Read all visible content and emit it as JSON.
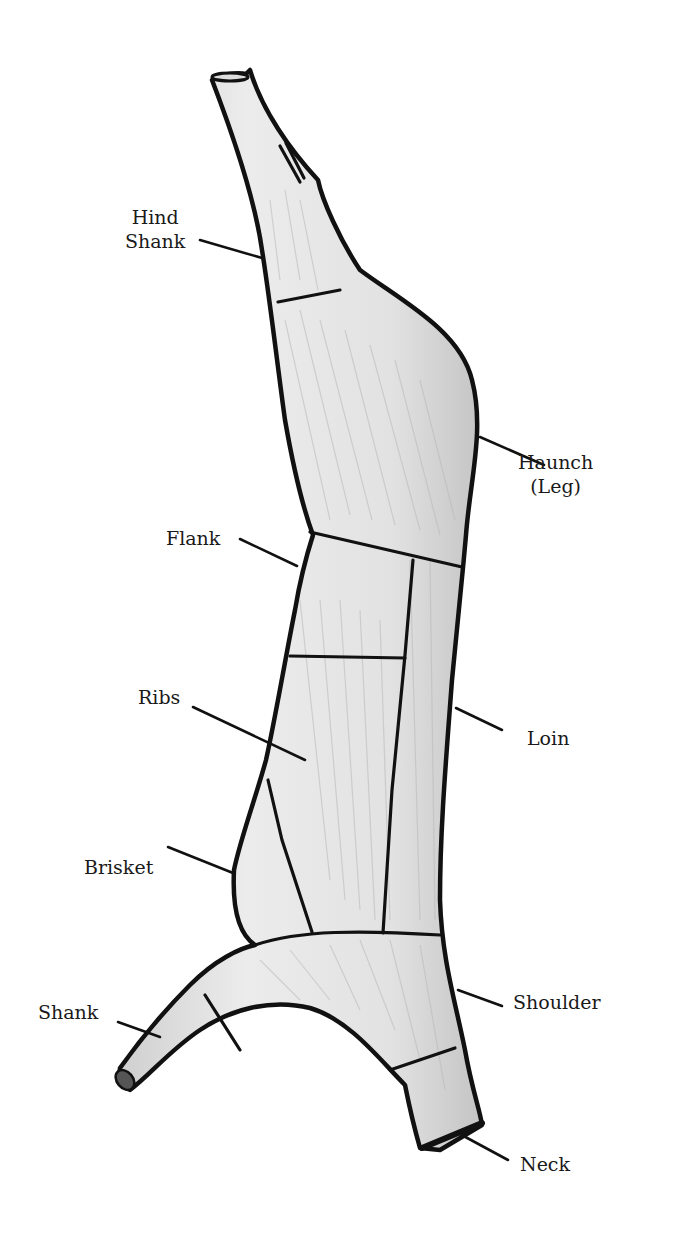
{
  "diagram": {
    "title": "",
    "style": "pencil sketch, grayscale",
    "colors": {
      "outline": "#111111",
      "fill": "#e6e6e6",
      "shading": "#b8b8b8",
      "background": "#ffffff"
    },
    "labels": [
      {
        "id": "hind-shank",
        "lines": [
          "Hind",
          "Shank"
        ],
        "x": 125,
        "y": 205,
        "align": "center",
        "leader": [
          [
            200,
            240
          ],
          [
            262,
            258
          ]
        ]
      },
      {
        "id": "haunch",
        "lines": [
          "Haunch",
          "(Leg)"
        ],
        "x": 518,
        "y": 450,
        "align": "center",
        "leader": [
          [
            480,
            437
          ],
          [
            544,
            465
          ]
        ]
      },
      {
        "id": "flank",
        "lines": [
          "Flank"
        ],
        "x": 166,
        "y": 526,
        "align": "left",
        "leader": [
          [
            240,
            539
          ],
          [
            297,
            566
          ]
        ]
      },
      {
        "id": "ribs",
        "lines": [
          "Ribs"
        ],
        "x": 138,
        "y": 685,
        "align": "left",
        "leader": [
          [
            193,
            707
          ],
          [
            305,
            760
          ]
        ]
      },
      {
        "id": "loin",
        "lines": [
          "Loin"
        ],
        "x": 527,
        "y": 726,
        "align": "left",
        "leader": [
          [
            456,
            708
          ],
          [
            502,
            730
          ]
        ]
      },
      {
        "id": "brisket",
        "lines": [
          "Brisket"
        ],
        "x": 84,
        "y": 855,
        "align": "left",
        "leader": [
          [
            168,
            847
          ],
          [
            233,
            873
          ]
        ]
      },
      {
        "id": "shoulder",
        "lines": [
          "Shoulder"
        ],
        "x": 513,
        "y": 990,
        "align": "left",
        "leader": [
          [
            458,
            990
          ],
          [
            502,
            1006
          ]
        ]
      },
      {
        "id": "shank",
        "lines": [
          "Shank"
        ],
        "x": 38,
        "y": 1000,
        "align": "left",
        "leader": [
          [
            118,
            1022
          ],
          [
            160,
            1037
          ]
        ]
      },
      {
        "id": "neck",
        "lines": [
          "Neck"
        ],
        "x": 520,
        "y": 1152,
        "align": "left",
        "leader": [
          [
            458,
            1133
          ],
          [
            508,
            1160
          ]
        ]
      }
    ]
  }
}
